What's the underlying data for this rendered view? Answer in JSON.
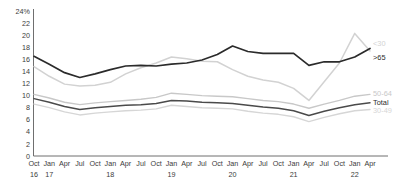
{
  "chart_data": {
    "type": "line",
    "title": "",
    "subtitle": "",
    "xlabel": "",
    "ylabel": "",
    "ylim": [
      0,
      24
    ],
    "grid": false,
    "legend_position": "right-inline",
    "y_ticks": [
      "0",
      "2",
      "4",
      "6",
      "8",
      "10",
      "12",
      "14",
      "16",
      "18",
      "20",
      "22",
      "24%"
    ],
    "y_tick_values": [
      0,
      2,
      4,
      6,
      8,
      10,
      12,
      14,
      16,
      18,
      20,
      22,
      24
    ],
    "categories": [
      "Oct 16",
      "Jan 17",
      "Apr 17",
      "Jul 17",
      "Oct 17",
      "Jan 18",
      "Apr 18",
      "Jul 18",
      "Oct 18",
      "Jan 19",
      "Apr 19",
      "Jul 19",
      "Oct 19",
      "Jan 20",
      "Apr 20",
      "Jul 20",
      "Oct 20",
      "Jan 21",
      "Apr 21",
      "Jul 21",
      "Oct 21",
      "Jan 22",
      "Apr 22"
    ],
    "x_month_labels": [
      "Oct",
      "Jan",
      "Apr",
      "Jul",
      "Oct",
      "Jan",
      "Apr",
      "Jul",
      "Oct",
      "Jan",
      "Apr",
      "Jul",
      "Oct",
      "Jan",
      "Apr",
      "Jul",
      "Oct",
      "Jan",
      "Apr",
      "Jul",
      "Oct",
      "Jan",
      "Apr"
    ],
    "x_year_labels": [
      {
        "index": 0,
        "label": "16"
      },
      {
        "index": 1,
        "label": "17"
      },
      {
        "index": 5,
        "label": "18"
      },
      {
        "index": 9,
        "label": "19"
      },
      {
        "index": 13,
        "label": "20"
      },
      {
        "index": 17,
        "label": "21"
      },
      {
        "index": 21,
        "label": "22"
      }
    ],
    "series": [
      {
        "name": "<30",
        "label": "<30",
        "color": "#d2d2d2",
        "width": 1.5,
        "label_y_value": 18.6,
        "values": [
          14.8,
          13.2,
          11.9,
          11.6,
          11.7,
          12.2,
          13.6,
          14.6,
          15.4,
          16.4,
          16.1,
          15.7,
          15.6,
          14.3,
          13.2,
          12.6,
          12.2,
          11.2,
          9.2,
          12.3,
          15.4,
          20.3,
          17.4
        ]
      },
      {
        "name": ">65",
        "label": ">65",
        "color": "#2b2b2b",
        "width": 1.7,
        "label_y_value": 16.3,
        "values": [
          16.5,
          15.2,
          13.8,
          13.0,
          13.6,
          14.3,
          14.9,
          15.0,
          14.9,
          15.2,
          15.4,
          15.9,
          16.8,
          18.2,
          17.3,
          17.0,
          17.0,
          17.0,
          15.0,
          15.6,
          15.6,
          16.4,
          17.8
        ]
      },
      {
        "name": "50-64",
        "label": "50-64",
        "color": "#c8c8c8",
        "width": 1.4,
        "label_y_value": 10.4,
        "values": [
          10.2,
          9.6,
          8.9,
          8.5,
          8.8,
          9.0,
          9.2,
          9.4,
          9.7,
          10.4,
          10.2,
          10.0,
          9.9,
          9.8,
          9.5,
          9.2,
          9.0,
          8.6,
          7.9,
          8.6,
          9.2,
          9.9,
          10.2
        ]
      },
      {
        "name": "Total",
        "label": "Total",
        "color": "#4a4a4a",
        "width": 1.5,
        "label_y_value": 8.9,
        "values": [
          9.5,
          8.9,
          8.2,
          7.7,
          8.0,
          8.2,
          8.4,
          8.5,
          8.7,
          9.2,
          9.1,
          8.9,
          8.8,
          8.7,
          8.4,
          8.1,
          7.9,
          7.5,
          6.7,
          7.4,
          8.0,
          8.5,
          8.8
        ]
      },
      {
        "name": "30-49",
        "label": "30-49",
        "color": "#d6d6d6",
        "width": 1.4,
        "label_y_value": 7.6,
        "values": [
          8.6,
          8.0,
          7.3,
          6.8,
          7.1,
          7.3,
          7.5,
          7.6,
          7.8,
          8.4,
          8.2,
          8.0,
          7.9,
          7.8,
          7.4,
          7.1,
          6.9,
          6.5,
          5.7,
          6.4,
          7.0,
          7.5,
          7.7
        ]
      }
    ]
  }
}
